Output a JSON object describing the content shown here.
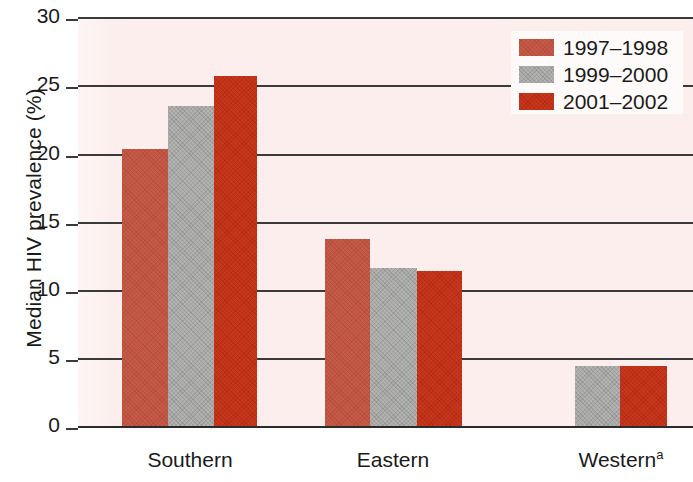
{
  "chart_data": {
    "type": "bar",
    "title": "",
    "xlabel": "",
    "ylabel": "Median HIV prevalence (%)",
    "ylim": [
      0,
      30
    ],
    "yticks": [
      0,
      5,
      10,
      15,
      20,
      25,
      30
    ],
    "ytick_labels": [
      "0",
      "5",
      "10",
      "15",
      "20",
      "25",
      "30"
    ],
    "grid": true,
    "legend_position": "top-right",
    "categories": [
      "Southern",
      "Eastern",
      "Western"
    ],
    "category_label_suffixes": [
      "",
      "",
      "a"
    ],
    "series": [
      {
        "name": "1997–1998",
        "color": "#c3523e",
        "values": [
          20.3,
          13.7,
          null
        ]
      },
      {
        "name": "1999–2000",
        "color": "#a9a9a7",
        "values": [
          23.5,
          11.6,
          4.4
        ]
      },
      {
        "name": "2001–2002",
        "color": "#c42f13",
        "values": [
          25.7,
          11.4,
          4.4
        ]
      }
    ],
    "annotations": [
      "a"
    ],
    "background_color": "#fbeeec"
  },
  "axis": {
    "y": {
      "label": "Median HIV prevalence (%)",
      "ticks": [
        {
          "value": 30,
          "label": "30"
        },
        {
          "value": 25,
          "label": "25"
        },
        {
          "value": 20,
          "label": "20"
        },
        {
          "value": 15,
          "label": "15"
        },
        {
          "value": 10,
          "label": "10"
        },
        {
          "value": 5,
          "label": "5"
        },
        {
          "value": 0,
          "label": "0"
        }
      ]
    },
    "x": {
      "ticks": [
        {
          "label": "Southern",
          "sup": ""
        },
        {
          "label": "Eastern",
          "sup": ""
        },
        {
          "label": "Western",
          "sup": "a"
        }
      ]
    }
  },
  "legend": {
    "items": [
      {
        "label": "1997–1998",
        "color": "#c3523e"
      },
      {
        "label": "1999–2000",
        "color": "#a9a9a7"
      },
      {
        "label": "2001–2002",
        "color": "#c42f13"
      }
    ]
  }
}
